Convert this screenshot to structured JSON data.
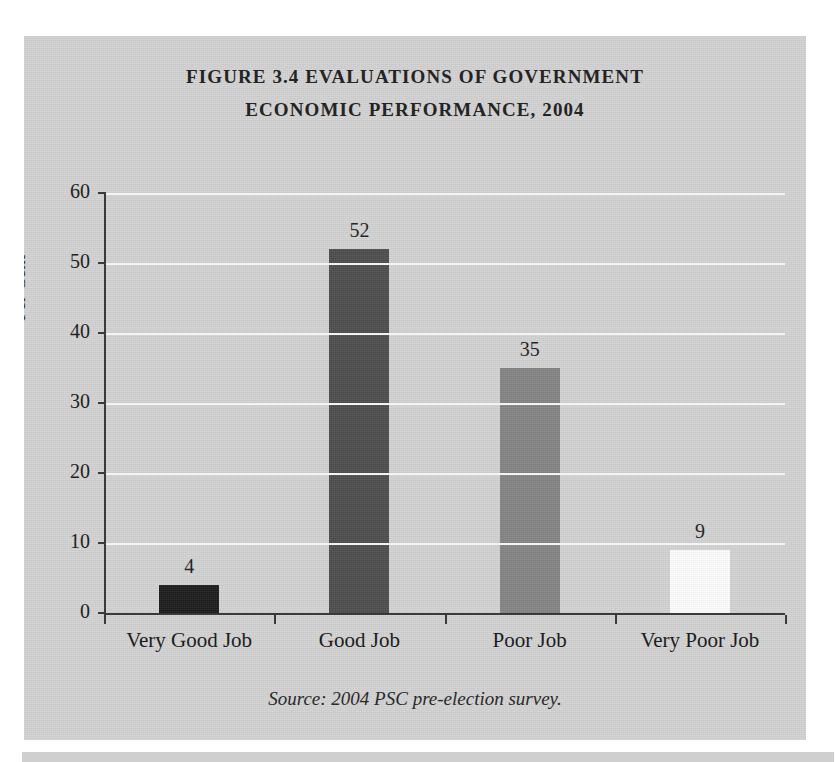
{
  "figure": {
    "title_line_1": "FIGURE 3.4 EVALUATIONS OF GOVERNMENT",
    "title_line_2": "ECONOMIC PERFORMANCE, 2004",
    "source_note": "Source: 2004 PSC pre-election survey."
  },
  "chart_data": {
    "type": "bar",
    "title": "FIGURE 3.4 EVALUATIONS OF GOVERNMENT ECONOMIC PERFORMANCE, 2004",
    "subtitle": "",
    "xlabel": "",
    "ylabel": "Per Cent",
    "ylim": [
      0,
      60
    ],
    "yticks": [
      0,
      10,
      20,
      30,
      40,
      50,
      60
    ],
    "ytick_labels": [
      "0",
      "10",
      "20",
      "30",
      "40",
      "50",
      "60"
    ],
    "categories": [
      "Very Good Job",
      "Good Job",
      "Poor Job",
      "Very Poor Job"
    ],
    "values": [
      4,
      52,
      35,
      9
    ],
    "value_labels": [
      "4",
      "52",
      "35",
      "9"
    ],
    "bar_colors": [
      "#1c1c1c",
      "#4d4d4d",
      "#848484",
      "#fcfcfc"
    ],
    "grid": "horizontal-white",
    "gridline_color": "#f4f4f4",
    "plot_background": "#d2d2d2",
    "axis_color": "#3a3a3a",
    "legend": "none",
    "source": "Source: 2004 PSC pre-election survey."
  }
}
